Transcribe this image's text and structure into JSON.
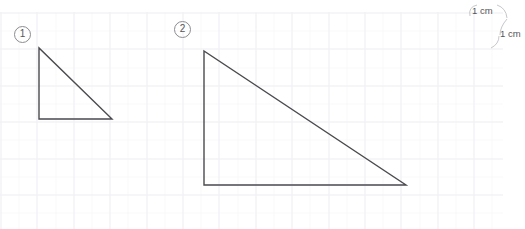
{
  "page": {
    "width": 525,
    "height": 229,
    "background_color": "#ffffff"
  },
  "grid": {
    "line_color_major": "#f0f0f3",
    "line_color_minor": "#f8f8fa",
    "major_spacing_px": 36.4,
    "minor_spacing_px": 18.2,
    "origin_x": 0,
    "origin_y": 12,
    "width": 503,
    "height": 217
  },
  "figures": [
    {
      "id": "figure-1",
      "label": "1",
      "label_style": "circled",
      "shape": "right-triangle",
      "stroke_color": "#4a4a4f",
      "stroke_width": 1.4,
      "vertices": [
        {
          "name": "apex",
          "x": 39,
          "y": 48
        },
        {
          "name": "bottom-left",
          "x": 39,
          "y": 119
        },
        {
          "name": "bottom-right",
          "x": 112,
          "y": 119
        }
      ],
      "leg_vertical_px": 71,
      "leg_horizontal_px": 73
    },
    {
      "id": "figure-2",
      "label": "2",
      "label_style": "circled",
      "shape": "right-triangle",
      "stroke_color": "#4a4a4f",
      "stroke_width": 1.4,
      "vertices": [
        {
          "name": "apex",
          "x": 204,
          "y": 51
        },
        {
          "name": "bottom-left",
          "x": 204,
          "y": 185
        },
        {
          "name": "bottom-right",
          "x": 406,
          "y": 185
        }
      ],
      "leg_vertical_px": 134,
      "leg_horizontal_px": 202
    }
  ],
  "labels": {
    "figure_one": "1",
    "figure_two": "2"
  },
  "scale_annotations": [
    {
      "id": "scale-top",
      "text": "1 cm",
      "x": 472,
      "y": 5,
      "orientation": "horizontal-extent"
    },
    {
      "id": "scale-bottom",
      "text": "1 cm",
      "x": 500,
      "y": 28,
      "orientation": "vertical-extent"
    }
  ],
  "scale": {
    "top_label": "1 cm",
    "bottom_label": "1 cm",
    "brace_color": "#b8b8bd"
  },
  "colors": {
    "figure_stroke": "#4a4a4f",
    "label_text": "#55555a",
    "circle_border": "#8c8c90",
    "grid_major": "#f0f0f3",
    "grid_minor": "#f8f8fa",
    "background": "#ffffff"
  }
}
